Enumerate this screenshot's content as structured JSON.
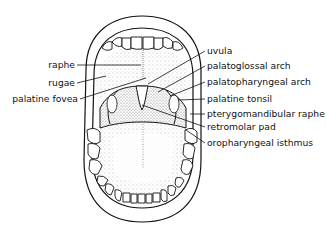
{
  "diagram": {
    "colors": {
      "ink": "#111111",
      "background": "#ffffff",
      "stipple": "#777777"
    },
    "labels_left": [
      {
        "id": "raphe",
        "text": "raphe"
      },
      {
        "id": "rugae",
        "text": "rugae"
      },
      {
        "id": "palatine-fovea",
        "text": "palatine fovea"
      }
    ],
    "labels_right": [
      {
        "id": "uvula",
        "text": "uvula"
      },
      {
        "id": "palatoglossal-arch",
        "text": "palatoglossal arch"
      },
      {
        "id": "palatopharyngeal-arch",
        "text": "palatopharyngeal arch"
      },
      {
        "id": "palatine-tonsil",
        "text": "palatine tonsil"
      },
      {
        "id": "pterygomandibular-raphe",
        "text": "pterygomandibular raphe"
      },
      {
        "id": "retromolar-pad",
        "text": "retromolar pad"
      },
      {
        "id": "oropharyngeal-isthmus",
        "text": "oropharyngeal isthmus"
      }
    ]
  }
}
